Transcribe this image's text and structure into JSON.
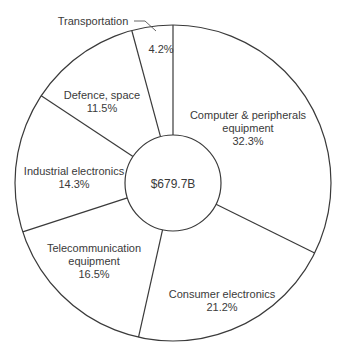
{
  "chart_data": {
    "type": "pie",
    "subtype": "donut",
    "title": "",
    "center_label": "$679.7B",
    "start_angle_deg": 0,
    "direction": "clockwise",
    "slices": [
      {
        "label": "Computer & peripherals equipment",
        "value": 32.3,
        "display": "32.3%"
      },
      {
        "label": "Consumer electronics",
        "value": 21.2,
        "display": "21.2%"
      },
      {
        "label": "Telecommunication equipment",
        "value": 16.5,
        "display": "16.5%"
      },
      {
        "label": "Industrial electronics",
        "value": 14.3,
        "display": "14.3%"
      },
      {
        "label": "Defence, space",
        "value": 11.5,
        "display": "11.5%"
      },
      {
        "label": "Transportation",
        "value": 4.2,
        "display": "4.2%"
      }
    ],
    "legend": "none",
    "grid": false
  },
  "labels": {
    "center": "$679.7B",
    "computer": {
      "line1": "Computer & peripherals",
      "line2": "equipment",
      "pct": "32.3%"
    },
    "consumer": {
      "line1": "Consumer electronics",
      "pct": "21.2%"
    },
    "telecom": {
      "line1": "Telecommunication",
      "line2": "equipment",
      "pct": "16.5%"
    },
    "industrial": {
      "line1": "Industrial electronics",
      "pct": "14.3%"
    },
    "defence": {
      "line1": "Defence, space",
      "pct": "11.5%"
    },
    "transport": {
      "line1": "Transportation",
      "pct": "4.2%"
    }
  },
  "colors": {
    "stroke": "#3a3a3a",
    "fill": "#ffffff",
    "text": "#3a3a3a"
  }
}
